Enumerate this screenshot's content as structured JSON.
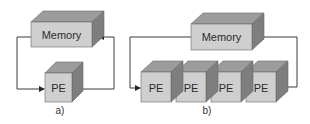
{
  "colors": {
    "front": "#cfcfcf",
    "top": "#9c9c9c",
    "side": "#7e7e7e",
    "edge": "#5a5a5a",
    "line": "#3a3a3a",
    "text": "#2b2b2b",
    "background": "#ffffff"
  },
  "diagrams": [
    {
      "id": "a",
      "caption": "a)",
      "memory": {
        "label": "Memory"
      },
      "pes": [
        {
          "label": "PE"
        }
      ]
    },
    {
      "id": "b",
      "caption": "b)",
      "memory": {
        "label": "Memory"
      },
      "pes": [
        {
          "label": "PE"
        },
        {
          "label": "PE"
        },
        {
          "label": "PE"
        },
        {
          "label": "PE"
        }
      ]
    }
  ]
}
